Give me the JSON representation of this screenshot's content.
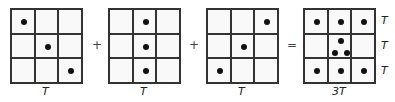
{
  "equation": {
    "operators": [
      "+",
      "+",
      "="
    ],
    "grids": [
      {
        "label": "T",
        "dots": [
          [
            0,
            0
          ],
          [
            1,
            1
          ],
          [
            2,
            2
          ]
        ]
      },
      {
        "label": "T",
        "dots": [
          [
            0,
            1
          ],
          [
            1,
            1
          ],
          [
            2,
            1
          ]
        ]
      },
      {
        "label": "T",
        "dots": [
          [
            0,
            2
          ],
          [
            1,
            1
          ],
          [
            2,
            0
          ]
        ]
      },
      {
        "label": "3T",
        "row_labels": [
          "T",
          "T",
          "T"
        ]
      }
    ]
  }
}
